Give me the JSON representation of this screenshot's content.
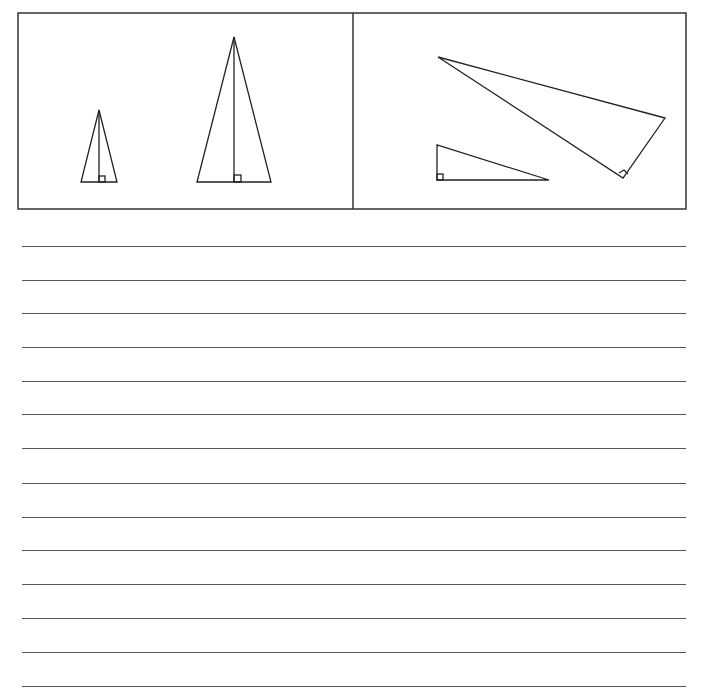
{
  "figure": {
    "panels": [
      {
        "name": "isosceles-triangles-panel",
        "shapes": [
          {
            "kind": "isosceles-triangle-with-altitude",
            "size": "small",
            "apex": [
              99,
              110
            ],
            "base_left": [
              81,
              182
            ],
            "base_right": [
              117,
              182
            ]
          },
          {
            "kind": "isosceles-triangle-with-altitude",
            "size": "large",
            "apex": [
              234,
              37
            ],
            "base_left": [
              197,
              182
            ],
            "base_right": [
              271,
              182
            ]
          }
        ]
      },
      {
        "name": "right-triangles-panel",
        "shapes": [
          {
            "kind": "right-triangle",
            "size": "small",
            "vertices": [
              [
                437,
                145
              ],
              [
                437,
                180
              ],
              [
                549,
                180
              ]
            ]
          },
          {
            "kind": "right-triangle",
            "size": "large",
            "vertices": [
              [
                438,
                57
              ],
              [
                665,
                118
              ],
              [
                623,
                178
              ]
            ]
          }
        ]
      }
    ]
  },
  "writing_lines": {
    "count": 14,
    "y_positions": [
      246,
      280,
      313,
      347,
      381,
      414,
      448,
      483,
      517,
      550,
      584,
      618,
      652,
      686
    ]
  }
}
